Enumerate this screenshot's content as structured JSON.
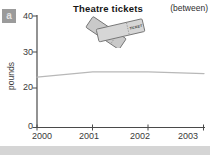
{
  "exercise": {
    "label": "a"
  },
  "header": {
    "title": "Theatre tickets",
    "hint": "(between)"
  },
  "tickets_icon": {
    "text": "TICKET",
    "fill_back": "#c9c9c9",
    "fill_front": "#d6d6d6",
    "stroke": "#757575"
  },
  "chart_data": {
    "type": "line",
    "title": "Theatre tickets",
    "xlabel": "",
    "ylabel": "pounds",
    "x": [
      2000,
      2001,
      2002,
      2003
    ],
    "xtick_labels": [
      "2000",
      "2001",
      "2002",
      "2003"
    ],
    "ytick_labels": [
      "40",
      "30",
      "20",
      "0"
    ],
    "yticks": [
      40,
      30,
      20,
      0
    ],
    "ylim": [
      0,
      40
    ],
    "grid": false,
    "legend": "none",
    "annotation": "(between)",
    "series": [
      {
        "name": "theatre-ticket-price",
        "values": [
          23,
          24.5,
          24.5,
          24
        ]
      }
    ],
    "line_color": "#b8b8b8",
    "axis_color": "#4a4a4a"
  }
}
